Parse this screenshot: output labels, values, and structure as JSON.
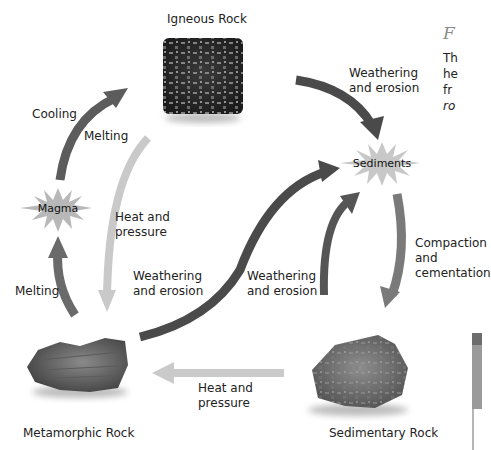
{
  "diagram": {
    "nodes": {
      "igneous": {
        "label": "Igneous Rock"
      },
      "sediments": {
        "label": "Sediments"
      },
      "magma": {
        "label": "Magma"
      },
      "metamorphic": {
        "label": "Metamorphic Rock"
      },
      "sedimentary": {
        "label": "Sedimentary Rock"
      }
    },
    "edges": [
      {
        "from": "magma",
        "to": "igneous",
        "label": "Cooling",
        "color": "#5a5a5a"
      },
      {
        "from": "igneous",
        "to": "sediments",
        "label": "Weathering and erosion",
        "color": "#4a4a4a"
      },
      {
        "from": "igneous",
        "to": "metamorphic",
        "label": "Heat and pressure",
        "color": "#c8c8c8"
      },
      {
        "from": "metamorphic",
        "to": "magma",
        "label": "Melting",
        "color": "#6b6b6b"
      },
      {
        "from": "metamorphic",
        "to": "sediments",
        "label": "Weathering and erosion",
        "color": "#4a4a4a"
      },
      {
        "from": "sedimentary",
        "to": "sediments",
        "label": "Weathering and erosion",
        "color": "#5a5a5a"
      },
      {
        "from": "sediments",
        "to": "sedimentary",
        "label": "Compaction and cementation",
        "color": "#7a7a7a"
      },
      {
        "from": "sedimentary",
        "to": "metamorphic",
        "label": "Heat and pressure",
        "color": "#c8c8c8"
      },
      {
        "from": "igneous",
        "to": "magma",
        "label": "Melting",
        "color": "#c8c8c8"
      }
    ],
    "labels": {
      "cooling": "Cooling",
      "melting_top": "Melting",
      "melting_left": "Melting",
      "weathering_top_1": "Weathering",
      "weathering_top_2": "and erosion",
      "heat_mid_1": "Heat and",
      "heat_mid_2": "pressure",
      "weathering_mid_1": "Weathering",
      "weathering_mid_2": "and erosion",
      "weathering_right_1": "Weathering",
      "weathering_right_2": "and erosion",
      "compaction_1": "Compaction",
      "compaction_2": "and",
      "compaction_3": "cementation",
      "heat_bottom_1": "Heat and",
      "heat_bottom_2": "pressure"
    }
  },
  "caption": {
    "title": "F",
    "lines": [
      "Th",
      "he",
      "fr",
      "ro"
    ]
  }
}
